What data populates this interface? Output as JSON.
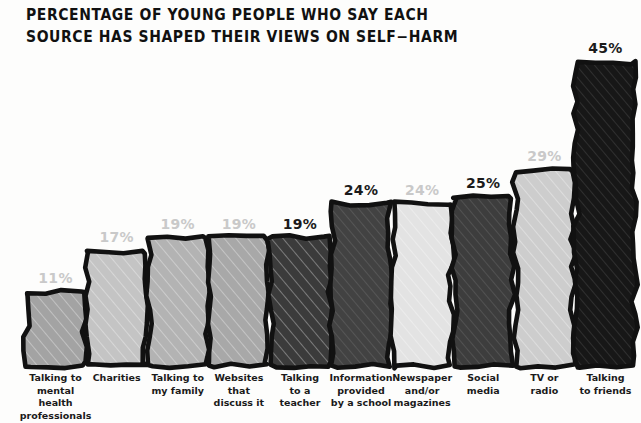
{
  "title": "PERCENTAGE OF YOUNG PEOPLE WHO SAY EACH\nSOURCE HAS SHAPED THEIR VIEWS ON SELF−HARM",
  "style": {
    "background": "#fdfdfc",
    "outline": "#111111",
    "label_dark": "#1b1b1b",
    "label_light": "#c9c9c9"
  },
  "chart_data": {
    "type": "bar",
    "title": "PERCENTAGE OF YOUNG PEOPLE WHO SAY EACH SOURCE HAS SHAPED THEIR VIEWS ON SELF−HARM",
    "xlabel": "",
    "ylabel": "",
    "ylim": [
      0,
      45
    ],
    "grid": false,
    "legend": "none",
    "categories": [
      "Talking to mental health professionals",
      "Charities",
      "Talking to my family",
      "Websites that discuss it",
      "Talking to a teacher",
      "Information provided by a school",
      "Newspaper and/or magazines",
      "Social media",
      "TV or radio",
      "Talking to friends"
    ],
    "values": [
      11,
      17,
      19,
      19,
      19,
      24,
      24,
      25,
      29,
      45
    ],
    "value_labels": [
      "11%",
      "17%",
      "19%",
      "19%",
      "19%",
      "24%",
      "24%",
      "25%",
      "29%",
      "45%"
    ]
  },
  "bars": [
    {
      "id": "bar-mental-health",
      "value": 11,
      "value_label": "11%",
      "label": "Talking to\nmental health\nprofessionals",
      "fill": "#a3a3a3",
      "label_color": "light"
    },
    {
      "id": "bar-charities",
      "value": 17,
      "value_label": "17%",
      "label": "Charities",
      "fill": "#c4c4c4",
      "label_color": "light"
    },
    {
      "id": "bar-family",
      "value": 19,
      "value_label": "19%",
      "label": "Talking to\nmy family",
      "fill": "#b3b3b3",
      "label_color": "light"
    },
    {
      "id": "bar-websites",
      "value": 19,
      "value_label": "19%",
      "label": "Websites\nthat\ndiscuss it",
      "fill": "#a8a8a8",
      "label_color": "light"
    },
    {
      "id": "bar-teacher",
      "value": 19,
      "value_label": "19%",
      "label": "Talking\nto a\nteacher",
      "fill": "#3b3b3b",
      "label_color": "dark"
    },
    {
      "id": "bar-school",
      "value": 24,
      "value_label": "24%",
      "label": "Information\nprovided\nby a school",
      "fill": "#424242",
      "label_color": "dark"
    },
    {
      "id": "bar-newspaper",
      "value": 24,
      "value_label": "24%",
      "label": "Newspaper\nand/or\nmagazines",
      "fill": "#e3e3e3",
      "label_color": "light"
    },
    {
      "id": "bar-social-media",
      "value": 25,
      "value_label": "25%",
      "label": "Social\nmedia",
      "fill": "#3d3d3d",
      "label_color": "dark"
    },
    {
      "id": "bar-tv-radio",
      "value": 29,
      "value_label": "29%",
      "label": "TV or\nradio",
      "fill": "#cdcdcd",
      "label_color": "light"
    },
    {
      "id": "bar-friends",
      "value": 45,
      "value_label": "45%",
      "label": "Talking\nto friends",
      "fill": "#171717",
      "label_color": "dark"
    }
  ]
}
